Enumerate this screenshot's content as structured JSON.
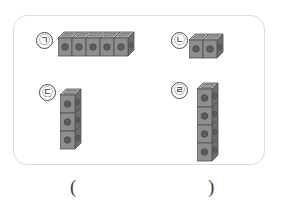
{
  "worksheet": {
    "panel_label": "cube-arrangement-panel",
    "border_color": "#dcdcdc"
  },
  "items": [
    {
      "label": "㉠",
      "orientation": "horizontal",
      "cube_count": 5,
      "name": "item-a"
    },
    {
      "label": "㉡",
      "orientation": "horizontal",
      "cube_count": 2,
      "name": "item-b"
    },
    {
      "label": "㉢",
      "orientation": "vertical",
      "cube_count": 3,
      "name": "item-c"
    },
    {
      "label": "㉣",
      "orientation": "vertical",
      "cube_count": 4,
      "name": "item-d"
    }
  ],
  "answer": {
    "open_paren": "(",
    "close_paren": ")",
    "value": ""
  },
  "colors": {
    "cube_front": "#8e8e8e",
    "cube_top": "#b4b4b4",
    "cube_side": "#6e6e6e",
    "cube_outline": "#4f4f4f",
    "stud_hole": "#555555",
    "panel_border": "#dcdcdc",
    "label_text": "#333333"
  }
}
